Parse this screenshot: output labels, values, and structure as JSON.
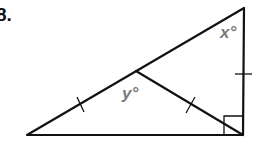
{
  "problem": {
    "number": "8."
  },
  "diagram": {
    "type": "right-triangle-with-median",
    "stroke_color": "#111111",
    "label_color": "#7a7a7a",
    "vertices": {
      "left": [
        27,
        135
      ],
      "top_right": [
        244,
        8
      ],
      "right_angle": [
        243,
        135
      ],
      "hypotenuse_point": [
        136,
        71
      ]
    },
    "labels": {
      "x": "x°",
      "y": "y°"
    },
    "tick_marks": [
      "left segment of hypotenuse",
      "median segment",
      "right vertical leg"
    ],
    "right_angle_marker": true
  }
}
